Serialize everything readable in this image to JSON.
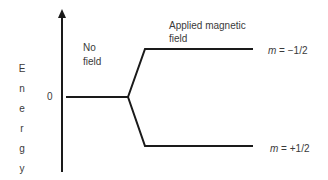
{
  "diagram": {
    "y_axis_label": "Energy",
    "y_axis_letters": [
      "E",
      "n",
      "e",
      "r",
      "g",
      "y"
    ],
    "zero_tick_label": "0",
    "region_labels": {
      "no_field_line1": "No",
      "no_field_line2": "field",
      "applied_line1": "Applied magnetic",
      "applied_line2": "field"
    },
    "levels": [
      {
        "name": "upper",
        "m_symbol": "m",
        "m_value": " = −1/2"
      },
      {
        "name": "lower",
        "m_symbol": "m",
        "m_value": " = +1/2"
      }
    ],
    "colors": {
      "line": "#1a1a1a",
      "text": "#3a3a3a",
      "background": "#ffffff"
    }
  }
}
